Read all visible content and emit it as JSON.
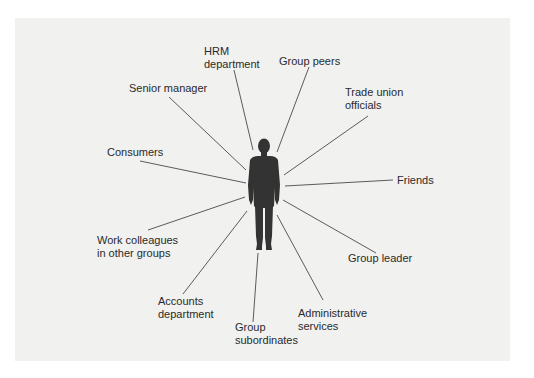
{
  "diagram": {
    "title": "",
    "center": {
      "name": "Individual",
      "icon": "person-silhouette-icon"
    },
    "colors": {
      "panel_background": "#f1f1f0",
      "page_background": "#ffffff",
      "line": "#4a4a4a",
      "figure": "#333333",
      "text": "#2a2a2a"
    },
    "nodes": [
      {
        "id": "hrm",
        "line1": "HRM",
        "line2": "department"
      },
      {
        "id": "group-peers",
        "line1": "Group peers",
        "line2": ""
      },
      {
        "id": "senior-manager",
        "line1": "Senior manager",
        "line2": ""
      },
      {
        "id": "trade-union",
        "line1": "Trade union",
        "line2": "officials"
      },
      {
        "id": "consumers",
        "line1": "Consumers",
        "line2": ""
      },
      {
        "id": "friends",
        "line1": "Friends",
        "line2": ""
      },
      {
        "id": "work-colleagues",
        "line1": "Work colleagues",
        "line2": "in other groups"
      },
      {
        "id": "group-leader",
        "line1": "Group leader",
        "line2": ""
      },
      {
        "id": "accounts",
        "line1": "Accounts",
        "line2": "department"
      },
      {
        "id": "administrative",
        "line1": "Administrative",
        "line2": "services"
      },
      {
        "id": "group-subordinates",
        "line1": "Group",
        "line2": "subordinates"
      }
    ]
  }
}
